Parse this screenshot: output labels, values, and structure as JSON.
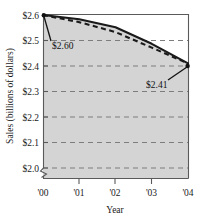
{
  "chart_data": {
    "type": "line",
    "title": "",
    "xlabel": "Year",
    "ylabel": "Sales (billions of dollars)",
    "x": [
      "'00",
      "'01",
      "'02",
      "'03",
      "'04"
    ],
    "xtick_labels": [
      "'00",
      "'01",
      "'02",
      "'03",
      "'04"
    ],
    "ytick_labels": [
      "$2.0",
      "$2.1",
      "$2.2",
      "$2.3",
      "$2.4",
      "$2.5",
      "$2.6"
    ],
    "ytick_values": [
      2.0,
      2.1,
      2.2,
      2.3,
      2.4,
      2.5,
      2.6
    ],
    "ylim": [
      2.0,
      2.6
    ],
    "xlim": [
      "'00",
      "'04"
    ],
    "grid": "horizontal-dashed",
    "legend": "none",
    "axis_break": true,
    "shaded_below_curve": true,
    "series": [
      {
        "name": "solid",
        "style": "solid",
        "values": [
          2.6,
          2.583,
          2.552,
          2.487,
          2.41
        ]
      },
      {
        "name": "dashed",
        "style": "dashed",
        "values": [
          2.6,
          2.572,
          2.533,
          2.472,
          2.41
        ]
      }
    ],
    "annotations": [
      {
        "text": "$2.60",
        "points_to_x": "'00",
        "points_to_y": 2.6,
        "label_x": 52,
        "label_y": 44
      },
      {
        "text": "$2.41",
        "points_to_x": "'04",
        "points_to_y": 2.41,
        "label_x": 151,
        "label_y": 84
      }
    ]
  },
  "axes": {
    "y_title": "Sales (billions of dollars)",
    "x_title": "Year",
    "y_labels": {
      "t6": "$2.6",
      "t5": "$2.5",
      "t4": "$2.4",
      "t3": "$2.3",
      "t2": "$2.2",
      "t1": "$2.1",
      "t0": "$2.0"
    },
    "x_labels": {
      "x0": "'00",
      "x1": "'01",
      "x2": "'02",
      "x3": "'03",
      "x4": "'04"
    }
  },
  "annotations": {
    "start_value": "$2.60",
    "end_value": "$2.41"
  },
  "colors": {
    "plot_fill": "#d4d4d4",
    "line": "#1a1a1a",
    "grid": "#7d7d7d",
    "axis": "#5a5a5a",
    "text": "#111111",
    "background": "#ffffff"
  }
}
